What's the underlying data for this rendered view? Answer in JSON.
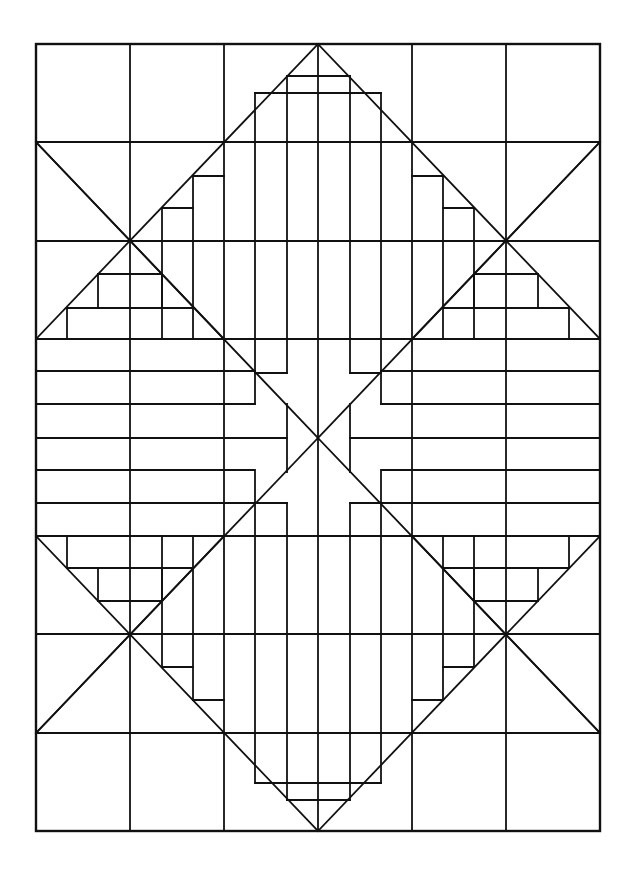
{
  "figure": {
    "width": 636,
    "height": 876,
    "stroke_color": "#111111",
    "background": "#ffffff",
    "frame": {
      "x": 36,
      "y": 44,
      "w": 564,
      "h": 787,
      "stroke_width": 2.4
    },
    "stroke_width": 1.8,
    "columns_x": [
      36,
      130,
      224,
      318,
      412,
      506,
      600
    ],
    "rows_y": [
      44,
      142,
      241,
      339,
      438,
      536,
      634,
      733,
      831
    ],
    "center": [
      318,
      438
    ],
    "diagonals": [
      [
        36,
        142,
        318,
        438
      ],
      [
        318,
        438,
        600,
        733
      ],
      [
        600,
        142,
        318,
        438
      ],
      [
        318,
        438,
        36,
        733
      ],
      [
        36,
        339,
        318,
        44
      ],
      [
        318,
        44,
        600,
        339
      ],
      [
        36,
        536,
        318,
        831
      ],
      [
        318,
        831,
        600,
        536
      ],
      [
        36,
        142,
        224,
        339
      ],
      [
        600,
        142,
        412,
        339
      ],
      [
        36,
        733,
        224,
        536
      ],
      [
        600,
        733,
        412,
        536
      ]
    ],
    "segments": [
      [
        36,
        142,
        600,
        142
      ],
      [
        36,
        241,
        600,
        241
      ],
      [
        36,
        339,
        600,
        339
      ],
      [
        36,
        536,
        600,
        536
      ],
      [
        36,
        634,
        600,
        634
      ],
      [
        36,
        733,
        600,
        733
      ],
      [
        130,
        44,
        130,
        831
      ],
      [
        224,
        44,
        224,
        831
      ],
      [
        412,
        44,
        412,
        831
      ],
      [
        506,
        44,
        506,
        831
      ],
      [
        318,
        44,
        318,
        831
      ],
      [
        255,
        93,
        381,
        93
      ],
      [
        255,
        93,
        255,
        339
      ],
      [
        381,
        93,
        381,
        339
      ],
      [
        287,
        76,
        350,
        76
      ],
      [
        287,
        76,
        287,
        339
      ],
      [
        350,
        76,
        350,
        339
      ],
      [
        255,
        339,
        255,
        404
      ],
      [
        381,
        339,
        381,
        404
      ],
      [
        287,
        339,
        287,
        373
      ],
      [
        350,
        339,
        350,
        373
      ],
      [
        224,
        339,
        255,
        339
      ],
      [
        255,
        783,
        381,
        783
      ],
      [
        255,
        783,
        255,
        536
      ],
      [
        381,
        783,
        381,
        536
      ],
      [
        287,
        800,
        350,
        800
      ],
      [
        287,
        800,
        287,
        536
      ],
      [
        350,
        800,
        350,
        536
      ],
      [
        255,
        536,
        255,
        472
      ],
      [
        381,
        536,
        381,
        472
      ],
      [
        287,
        536,
        287,
        503
      ],
      [
        350,
        536,
        350,
        503
      ],
      [
        36,
        371,
        255,
        371
      ],
      [
        36,
        404,
        255,
        404
      ],
      [
        36,
        438,
        287,
        438
      ],
      [
        36,
        470,
        255,
        470
      ],
      [
        36,
        503,
        255,
        503
      ],
      [
        381,
        371,
        600,
        371
      ],
      [
        381,
        404,
        600,
        404
      ],
      [
        350,
        438,
        600,
        438
      ],
      [
        381,
        470,
        600,
        470
      ],
      [
        381,
        503,
        600,
        503
      ],
      [
        255,
        373,
        287,
        373
      ],
      [
        350,
        373,
        381,
        373
      ],
      [
        255,
        503,
        287,
        503
      ],
      [
        350,
        503,
        381,
        503
      ],
      [
        287,
        404,
        287,
        472
      ],
      [
        350,
        404,
        350,
        472
      ],
      [
        193,
        176,
        193,
        339
      ],
      [
        162,
        208,
        162,
        339
      ],
      [
        162,
        208,
        193,
        208
      ],
      [
        193,
        176,
        224,
        176
      ],
      [
        67,
        308,
        193,
        308
      ],
      [
        98,
        274,
        162,
        274
      ],
      [
        67,
        308,
        67,
        339
      ],
      [
        98,
        274,
        98,
        308
      ],
      [
        162,
        274,
        162,
        308
      ],
      [
        443,
        176,
        443,
        339
      ],
      [
        474,
        208,
        474,
        339
      ],
      [
        443,
        208,
        474,
        208
      ],
      [
        412,
        176,
        443,
        176
      ],
      [
        443,
        308,
        569,
        308
      ],
      [
        474,
        274,
        538,
        274
      ],
      [
        569,
        308,
        569,
        339
      ],
      [
        538,
        274,
        538,
        308
      ],
      [
        474,
        274,
        474,
        308
      ],
      [
        193,
        700,
        193,
        536
      ],
      [
        162,
        667,
        162,
        536
      ],
      [
        162,
        667,
        193,
        667
      ],
      [
        193,
        700,
        224,
        700
      ],
      [
        67,
        568,
        193,
        568
      ],
      [
        98,
        601,
        162,
        601
      ],
      [
        67,
        536,
        67,
        568
      ],
      [
        98,
        568,
        98,
        601
      ],
      [
        162,
        568,
        162,
        601
      ],
      [
        443,
        700,
        443,
        536
      ],
      [
        474,
        667,
        474,
        536
      ],
      [
        443,
        667,
        474,
        667
      ],
      [
        412,
        700,
        443,
        700
      ],
      [
        443,
        568,
        569,
        568
      ],
      [
        474,
        601,
        538,
        601
      ],
      [
        569,
        536,
        569,
        568
      ],
      [
        538,
        568,
        538,
        601
      ],
      [
        474,
        568,
        474,
        601
      ]
    ]
  }
}
